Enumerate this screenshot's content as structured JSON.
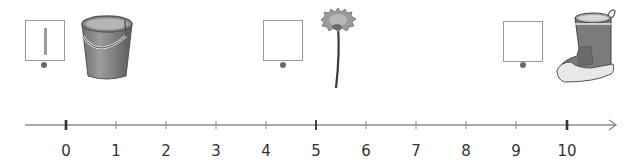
{
  "exercise": {
    "description": "Number line with three measured objects; write each object's length in its box",
    "items": [
      {
        "name": "bucket",
        "answer_box_value": "1",
        "box_marker": "dot"
      },
      {
        "name": "dandelion",
        "answer_box_value": "",
        "box_marker": "dot"
      },
      {
        "name": "boot",
        "answer_box_value": "",
        "box_marker": "dot"
      }
    ]
  },
  "number_line": {
    "min": 0,
    "max": 10,
    "tick_labels": [
      "0",
      "1",
      "2",
      "3",
      "4",
      "5",
      "6",
      "7",
      "8",
      "9",
      "10"
    ],
    "major_ticks": [
      0,
      5,
      10
    ],
    "arrow": "right"
  },
  "colors": {
    "line": "#8a8a8a",
    "major_tick": "#333333",
    "minor_tick": "#8a8a8a",
    "label": "#333333",
    "box_border": "#9a9a9a"
  }
}
